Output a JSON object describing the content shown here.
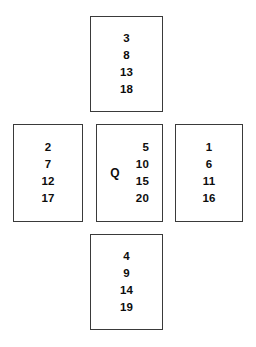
{
  "diagram": {
    "type": "cross-card-layout",
    "background_color": "#ffffff",
    "border_color": "#3a3a3a",
    "text_color": "#0d0d0d",
    "cards": {
      "top": {
        "position": "top",
        "numbers": [
          "3",
          "8",
          "13",
          "18"
        ]
      },
      "left": {
        "position": "left",
        "numbers": [
          "2",
          "7",
          "12",
          "17"
        ]
      },
      "center": {
        "position": "center",
        "label": "Q",
        "numbers": [
          "5",
          "10",
          "15",
          "20"
        ]
      },
      "right": {
        "position": "right",
        "numbers": [
          "1",
          "6",
          "11",
          "16"
        ]
      },
      "bottom": {
        "position": "bottom",
        "numbers": [
          "4",
          "9",
          "14",
          "19"
        ]
      }
    }
  }
}
